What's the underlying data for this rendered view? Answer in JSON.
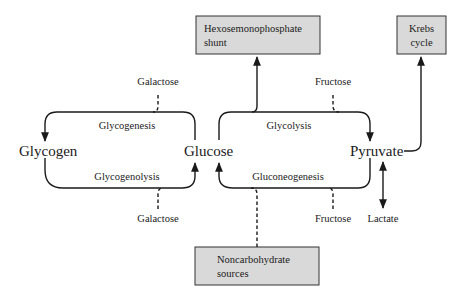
{
  "diagram": {
    "nodes": {
      "glycogen": "Glycogen",
      "glucose": "Glucose",
      "pyruvate": "Pyruvate",
      "lactate": "Lactate"
    },
    "boxes": {
      "hmp_line1": "Hexosemonophosphate",
      "hmp_line2": "shunt",
      "krebs_line1": "Krebs",
      "krebs_line2": "cycle",
      "noncarb_line1": "Noncarbohydrate",
      "noncarb_line2": "sources"
    },
    "processes": {
      "glycogenesis": "Glycogenesis",
      "glycogenolysis": "Glycogenolysis",
      "glycolysis": "Glycolysis",
      "gluconeogenesis": "Gluconeogenesis"
    },
    "inputs": {
      "galactose_top": "Galactose",
      "galactose_bottom": "Galactose",
      "fructose_top": "Fructose",
      "fructose_bottom": "Fructose"
    },
    "colors": {
      "box_fill": "#d9d9d9",
      "line": "#1a1a1a"
    }
  }
}
